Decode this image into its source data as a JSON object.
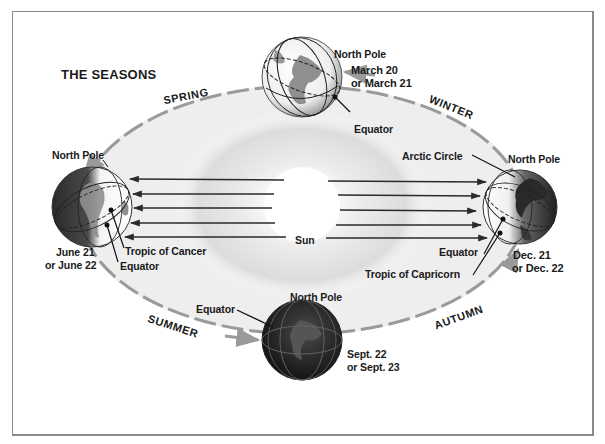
{
  "title": "THE SEASONS",
  "colors": {
    "frame": "#8a8a8a",
    "orbit": "#9a9a9a",
    "text": "#1a1a1a",
    "sun_glow": "#d9d9d9",
    "globe_dark": "#1c1c1c",
    "globe_light": "#f2f2f2",
    "land_gray": "#8f8f8f"
  },
  "seasons": {
    "spring": "SPRING",
    "winter": "WINTER",
    "summer": "SUMMER",
    "autumn": "AUTUMN"
  },
  "sun": {
    "label": "Sun"
  },
  "globes": {
    "top": {
      "north_pole": "North Pole",
      "date_line1": "March 20",
      "date_line2": "or March 21",
      "equator": "Equator"
    },
    "left": {
      "north_pole": "North Pole",
      "date_line1": "June 21",
      "date_line2": "or June 22",
      "tropic": "Tropic of Cancer",
      "equator": "Equator"
    },
    "right": {
      "arctic_circle": "Arctic Circle",
      "north_pole": "North Pole",
      "equator": "Equator",
      "tropic": "Tropic of Capricorn",
      "date_line1": "Dec. 21",
      "date_line2": "or Dec. 22"
    },
    "bottom": {
      "north_pole": "North Pole",
      "equator": "Equator",
      "date_line1": "Sept. 22",
      "date_line2": "or Sept. 23"
    }
  }
}
